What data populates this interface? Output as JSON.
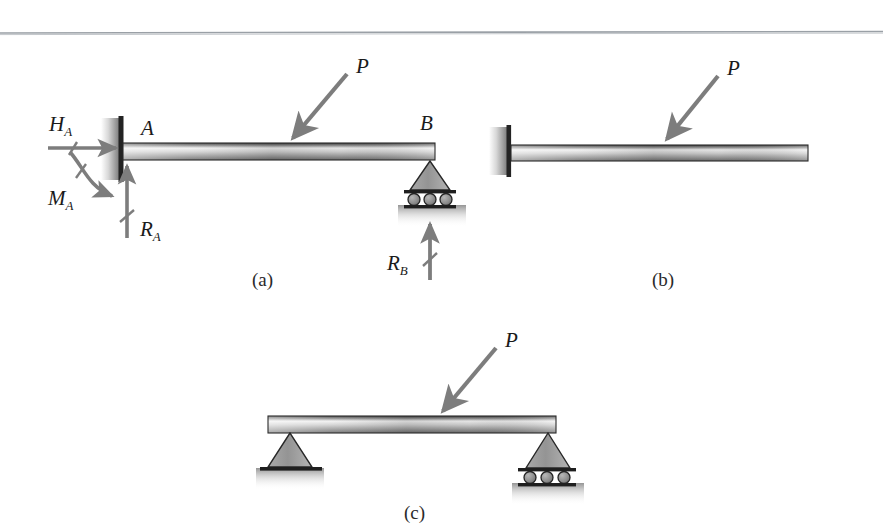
{
  "figure": {
    "page_rule": "horizontal-rule",
    "panels": [
      {
        "id": "a",
        "caption": "(a)",
        "type": "propped-cantilever-free-body-diagram",
        "node_labels": [
          "A",
          "B"
        ],
        "load_label": "P",
        "reaction_labels": [
          {
            "symbol": "H",
            "subscript": "A",
            "direction": "horizontal-right"
          },
          {
            "symbol": "M",
            "subscript": "A",
            "direction": "moment-clockwise"
          },
          {
            "symbol": "R",
            "subscript": "A",
            "direction": "vertical-up"
          },
          {
            "symbol": "R",
            "subscript": "B",
            "direction": "vertical-up"
          }
        ],
        "supports": [
          "fixed-wall",
          "roller"
        ]
      },
      {
        "id": "b",
        "caption": "(b)",
        "type": "cantilever-beam",
        "load_label": "P",
        "supports": [
          "fixed-wall"
        ]
      },
      {
        "id": "c",
        "caption": "(c)",
        "type": "simply-supported-beam",
        "load_label": "P",
        "supports": [
          "pin",
          "roller"
        ]
      }
    ]
  },
  "labels": {
    "a": {
      "node_a": "A",
      "node_b": "B",
      "load": "P",
      "h_a_symbol": "H",
      "h_a_sub": "A",
      "m_a_symbol": "M",
      "m_a_sub": "A",
      "r_a_symbol": "R",
      "r_a_sub": "A",
      "r_b_symbol": "R",
      "r_b_sub": "B",
      "caption": "(a)"
    },
    "b": {
      "load": "P",
      "caption": "(b)"
    },
    "c": {
      "load": "P",
      "caption": "(c)"
    }
  },
  "colors": {
    "beam_dark": "#4a4a4a",
    "beam_light": "#ededed",
    "arrow_gray": "#7d7d7d",
    "support_gray": "#9a9a9a",
    "outline": "#1c1c1c",
    "rule": "#9aa0a6",
    "text": "#1a1a1a"
  }
}
